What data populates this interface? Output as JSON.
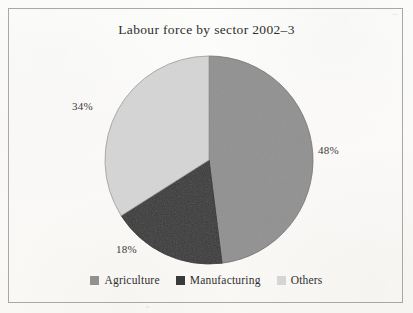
{
  "chart_data": {
    "type": "pie",
    "title": "Labour force by sector 2002–3",
    "categories": [
      "Agriculture",
      "Manufacturing",
      "Others"
    ],
    "values": [
      48,
      18,
      34
    ],
    "value_labels": [
      "48%",
      "18%",
      "34%"
    ],
    "unit": "%",
    "start_angle_deg": 0,
    "direction": "clockwise",
    "colors": [
      "#919191",
      "#3a3a3a",
      "#d5d5d5"
    ],
    "legend_position": "bottom",
    "grid": false,
    "xlabel": "",
    "ylabel": ""
  },
  "figure": {
    "title": "Labour force by sector 2002–3",
    "border_color": "#a8a8a8",
    "paper_color": "#fbfbf9"
  },
  "labels": {
    "agriculture": "48%",
    "manufacturing": "18%",
    "others": "34%"
  },
  "legend": {
    "items": [
      {
        "label": "Agriculture",
        "color": "#919191"
      },
      {
        "label": "Manufacturing",
        "color": "#3a3a3a"
      },
      {
        "label": "Others",
        "color": "#d5d5d5"
      }
    ]
  }
}
